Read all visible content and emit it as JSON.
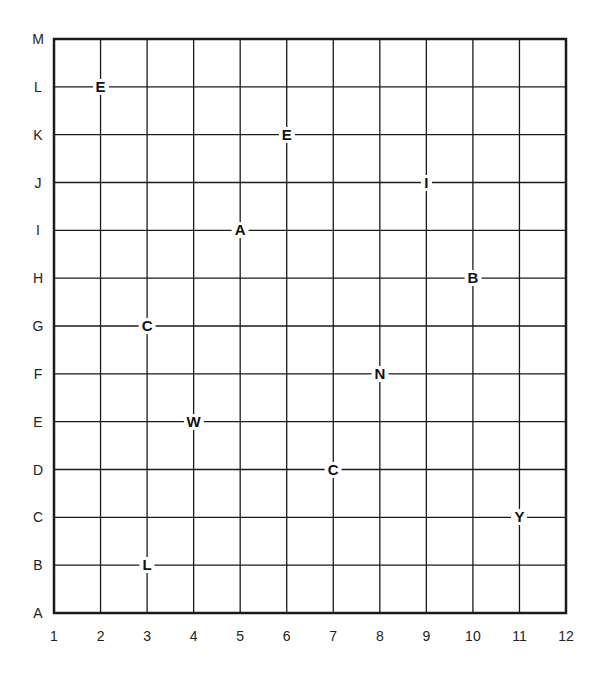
{
  "grid": {
    "row_labels": [
      "A",
      "B",
      "C",
      "D",
      "E",
      "F",
      "G",
      "H",
      "I",
      "J",
      "K",
      "L",
      "M"
    ],
    "col_labels": [
      "1",
      "2",
      "3",
      "4",
      "5",
      "6",
      "7",
      "8",
      "9",
      "10",
      "11",
      "12"
    ],
    "line_color": "#1a1a1a",
    "background": "#ffffff"
  },
  "markers": [
    {
      "letter": "E",
      "col": 2,
      "row": "L"
    },
    {
      "letter": "E",
      "col": 6,
      "row": "K"
    },
    {
      "letter": "I",
      "col": 9,
      "row": "J"
    },
    {
      "letter": "A",
      "col": 5,
      "row": "I"
    },
    {
      "letter": "B",
      "col": 10,
      "row": "H"
    },
    {
      "letter": "C",
      "col": 3,
      "row": "G"
    },
    {
      "letter": "N",
      "col": 8,
      "row": "F"
    },
    {
      "letter": "W",
      "col": 4,
      "row": "E"
    },
    {
      "letter": "C",
      "col": 7,
      "row": "D"
    },
    {
      "letter": "Y",
      "col": 11,
      "row": "C"
    },
    {
      "letter": "L",
      "col": 3,
      "row": "B"
    }
  ]
}
